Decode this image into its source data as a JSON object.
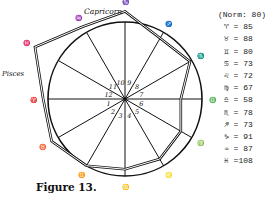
{
  "chart_data": {
    "type": "radar",
    "title": "",
    "caption": "Figure 13.",
    "norm_label": "(Norm: 80)",
    "norm": 80,
    "categories": [
      "Aries",
      "Taurus",
      "Gemini",
      "Cancer",
      "Leo",
      "Virgo",
      "Libra",
      "Scorpio",
      "Sagittarius",
      "Capricorn",
      "Aquarius",
      "Pisces"
    ],
    "symbols": [
      "♈",
      "♉",
      "♊",
      "♋",
      "♌",
      "♍",
      "♎",
      "♏",
      "♐",
      "♑",
      "♒",
      "♓"
    ],
    "values": [
      85,
      88,
      80,
      73,
      72,
      67,
      58,
      78,
      73,
      91,
      87,
      108
    ],
    "house_numbers": [
      "1",
      "2",
      "3",
      "4",
      "5",
      "6",
      "7",
      "8",
      "9",
      "10",
      "11",
      "12"
    ],
    "named_labels": {
      "capricorn": "Capricorn",
      "pisces": "Pisces"
    },
    "grid": true,
    "legend_position": "right"
  },
  "legend": {
    "norm": "(Norm: 80)",
    "rows": [
      {
        "symbol": "♈",
        "text": "= 85"
      },
      {
        "symbol": "♉",
        "text": "= 88"
      },
      {
        "symbol": "♊",
        "text": "= 80"
      },
      {
        "symbol": "♋",
        "text": "= 73"
      },
      {
        "symbol": "♌",
        "text": "= 72"
      },
      {
        "symbol": "♍",
        "text": "= 67"
      },
      {
        "symbol": "♎",
        "text": "= 58"
      },
      {
        "symbol": "♏",
        "text": "= 78"
      },
      {
        "symbol": "♐",
        "text": "= 73"
      },
      {
        "symbol": "♑",
        "text": "= 91"
      },
      {
        "symbol": "♒",
        "text": "= 87"
      },
      {
        "symbol": "♓",
        "text": "=108"
      }
    ]
  },
  "caption": "Figure 13.",
  "labels": {
    "capricorn": "Capricorn",
    "pisces": "Pisces"
  }
}
